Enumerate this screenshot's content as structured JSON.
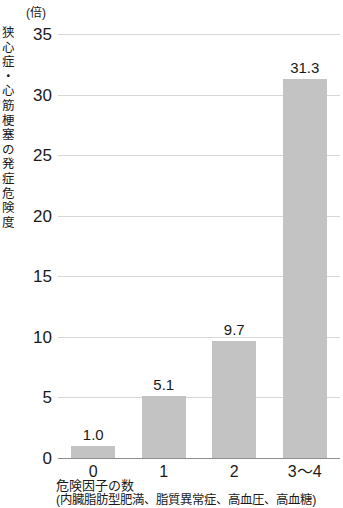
{
  "chart_data": {
    "type": "bar",
    "title": "",
    "subtitle": "",
    "unit_label": "(倍)",
    "ylabel": "狭心症・心筋梗塞の発症危険度",
    "xlabel": "危険因子の数",
    "xlabel_note": "(内臓脂肪型肥満、脂質異常症、高血圧、高血糖)",
    "categories": [
      "0",
      "1",
      "2",
      "3～4"
    ],
    "values": [
      1.0,
      5.1,
      9.7,
      31.3
    ],
    "value_labels": [
      "1.0",
      "5.1",
      "9.7",
      "31.3"
    ],
    "ylim": [
      0,
      35
    ],
    "yticks": [
      0,
      5,
      10,
      15,
      20,
      25,
      30,
      35
    ],
    "ytick_labels": [
      "0",
      "5",
      "10",
      "15",
      "20",
      "25",
      "30",
      "35"
    ],
    "grid": true,
    "legend": "none",
    "colors": {
      "bar_fill": "#c3c3c3",
      "gridline": "#d8d8d8",
      "axis_line": "#8d8d8d",
      "text": "#1a1a1a",
      "background": "#ffffff"
    }
  },
  "y_axis_title_chars": "狭心症・心筋梗塞の発症危険度"
}
